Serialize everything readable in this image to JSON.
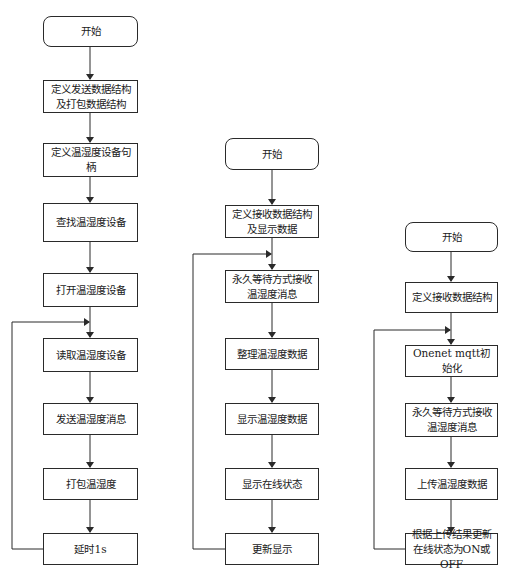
{
  "flowcharts": [
    {
      "name": "sender",
      "steps": [
        "开始",
        "定义发送数据结构及打包数据结构",
        "定义温湿度设备句柄",
        "查找温湿度设备",
        "打开温湿度设备",
        "读取温湿度设备",
        "发送温湿度消息",
        "打包温湿度",
        "延时1s"
      ],
      "loop": {
        "from": "延时1s",
        "to": "读取温湿度设备"
      }
    },
    {
      "name": "display",
      "steps": [
        "开始",
        "定义接收数据结构及显示数据",
        "永久等待方式接收温湿度消息",
        "整理温湿度数据",
        "显示温湿度数据",
        "显示在线状态",
        "更新显示"
      ],
      "loop": {
        "from": "更新显示",
        "to": "永久等待方式接收温湿度消息"
      }
    },
    {
      "name": "upload",
      "steps": [
        "开始",
        "定义接收数据结构",
        "Onenet mqtt初始化",
        "永久等待方式接收温湿度消息",
        "上传温湿度数据",
        "根据上传结果更新在线状态为ON或OFF"
      ],
      "loop": {
        "from": "根据上传结果更新在线状态为ON或OFF",
        "to": "Onenet mqtt初始化"
      }
    }
  ],
  "colors": {
    "line": "#2a2a2a",
    "background": "#ffffff"
  }
}
